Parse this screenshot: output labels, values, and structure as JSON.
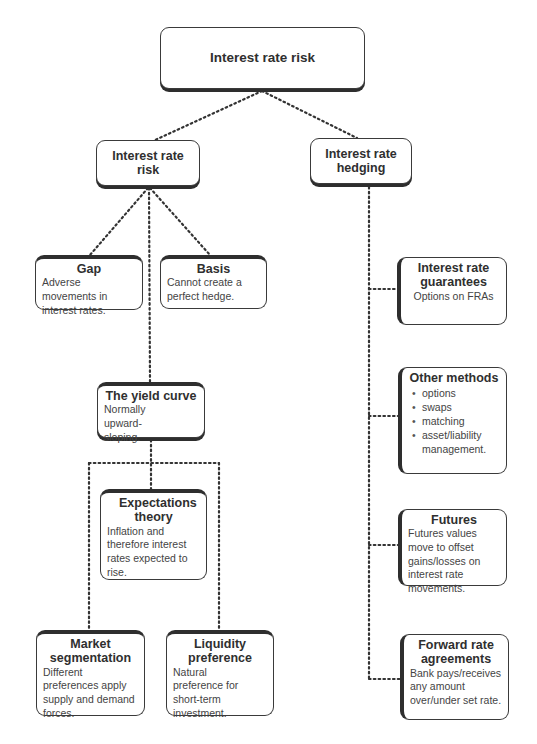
{
  "diagram": {
    "root": {
      "title": "Interest rate risk"
    },
    "left_branch": {
      "title": "Interest rate risk",
      "children": {
        "gap": {
          "title": "Gap",
          "desc": "Adverse movements in interest rates."
        },
        "basis": {
          "title": "Basis",
          "desc": "Cannot create a perfect hedge."
        },
        "yield_curve": {
          "title": "The yield curve",
          "desc": "Normally upward-sloping.",
          "children": {
            "expectations": {
              "title": "Expectations theory",
              "desc": "Inflation and therefore interest rates expected to rise."
            },
            "market_segmentation": {
              "title": "Market segmentation",
              "desc": "Different preferences apply supply and demand forces."
            },
            "liquidity_preference": {
              "title": "Liquidity preference",
              "desc": "Natural preference for short-term investment."
            }
          }
        }
      }
    },
    "right_branch": {
      "title": "Interest rate hedging",
      "children": {
        "guarantees": {
          "title": "Interest rate guarantees",
          "desc": "Options on FRAs"
        },
        "other_methods": {
          "title": "Other methods",
          "items": [
            "options",
            "swaps",
            "matching",
            "asset/liability management."
          ]
        },
        "futures": {
          "title": "Futures",
          "desc": "Futures values move to offset gains/losses on interest rate movements."
        },
        "fra": {
          "title": "Forward rate agreements",
          "desc": "Bank pays/receives any amount over/under set rate."
        }
      }
    }
  }
}
